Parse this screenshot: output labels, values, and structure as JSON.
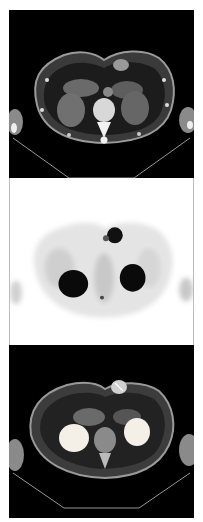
{
  "figure": {
    "panels": [
      {
        "id": "ct",
        "label": "Axial CT",
        "background": "#000000"
      },
      {
        "id": "pet",
        "label": "Axial PET (inverted grayscale)",
        "background": "#ffffff"
      },
      {
        "id": "fused",
        "label": "Fused PET/CT",
        "background": "#000000"
      }
    ],
    "colors": {
      "soft_tissue": "#6e6e6e",
      "bone": "#f2f2f2",
      "fat": "#2a2a2a",
      "pet_uptake": "#0a0a0a",
      "pet_background": "#e6e6e6",
      "fused_hotspot": "#f4f0e8"
    }
  }
}
